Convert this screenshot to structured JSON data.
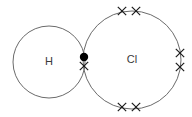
{
  "diagram": {
    "type": "dot-and-cross",
    "background_color": "#ffffff",
    "circle_stroke_color": "#6b6b6b",
    "electron_color": "#000000",
    "label_color": "#3a3a3a",
    "atoms": [
      {
        "id": "hydrogen",
        "label": "H",
        "label_x": 49,
        "label_y": 62,
        "circle": {
          "cx": 49,
          "cy": 62,
          "r": 36
        }
      },
      {
        "id": "chlorine",
        "label": "Cl",
        "label_x": 132,
        "label_y": 60,
        "circle": {
          "cx": 132,
          "cy": 60,
          "r": 49
        }
      }
    ],
    "bonding_pair": {
      "name": "shared-electron-pair",
      "dot": {
        "cx": 84,
        "cy": 57,
        "r": 4.2,
        "belongs_to": "hydrogen",
        "symbol": "dot"
      },
      "cross": {
        "cx": 84,
        "cy": 66,
        "size": 4.2,
        "belongs_to": "chlorine",
        "symbol": "cross"
      }
    },
    "lone_pairs": [
      {
        "name": "lone-pair-top",
        "crosses": [
          {
            "cx": 122,
            "cy": 11
          },
          {
            "cx": 136,
            "cy": 11
          }
        ]
      },
      {
        "name": "lone-pair-right",
        "crosses": [
          {
            "cx": 180,
            "cy": 53
          },
          {
            "cx": 180,
            "cy": 67
          }
        ]
      },
      {
        "name": "lone-pair-bottom",
        "crosses": [
          {
            "cx": 122,
            "cy": 107
          },
          {
            "cx": 136,
            "cy": 107
          }
        ]
      }
    ],
    "cross_size": 4.2,
    "electron_counts": {
      "hydrogen_dots": 1,
      "chlorine_crosses": 7
    }
  }
}
